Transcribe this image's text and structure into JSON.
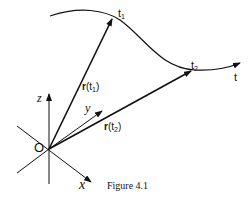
{
  "figure": {
    "caption": "Figure 4.1",
    "origin_label": "O",
    "axes": {
      "x": "x",
      "y": "y",
      "z": "z"
    },
    "curve_param_label": "t",
    "points": [
      {
        "label": "t",
        "sub": "1"
      },
      {
        "label": "t",
        "sub": "2"
      }
    ],
    "vectors": [
      {
        "label_bold": "r",
        "label_open": "(t",
        "sub": "1",
        "label_close": ")"
      },
      {
        "label_bold": "r",
        "label_open": "(t",
        "sub": "2",
        "label_close": ")"
      }
    ]
  }
}
